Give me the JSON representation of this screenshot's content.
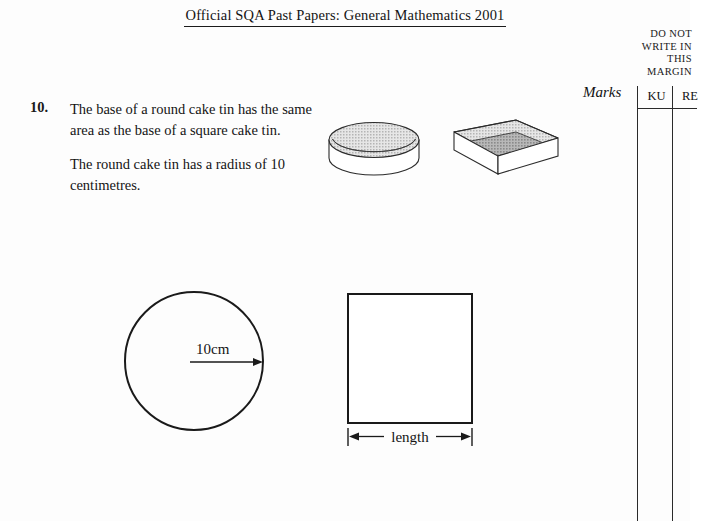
{
  "header": {
    "title": "Official SQA Past Papers: General Mathematics 2001"
  },
  "margin_notice": {
    "line1": "DO NOT",
    "line2": "WRITE IN",
    "line3": "THIS",
    "line4": "MARGIN"
  },
  "marks": {
    "label": "Marks",
    "columns": [
      "KU",
      "RE"
    ]
  },
  "question": {
    "number": "10.",
    "paragraph1": "The base of a round cake tin has the same area as the base of a square cake tin.",
    "paragraph2": "The round cake tin has a radius of 10 centimetres."
  },
  "figures": {
    "round_tin": {
      "name": "round cake tin",
      "rim_fill": "#d0d0d0",
      "inner_fill": "#9a9a9a",
      "outline": "#2b2b2b"
    },
    "square_tin": {
      "name": "square cake tin",
      "wall_fill": "#cfcfcf",
      "base_fill": "#a6a6a6",
      "side_fill": "#ffffff",
      "outline": "#2b2b2b"
    },
    "circle": {
      "radius_label": "10cm"
    },
    "square": {
      "dimension_label": "length"
    }
  },
  "colors": {
    "page_background": "#fdfdfd",
    "ink": "#1a1a1a",
    "rule": "#2a2a2a"
  }
}
